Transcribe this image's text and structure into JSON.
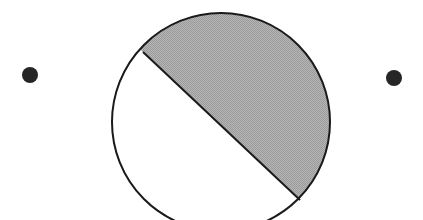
{
  "figure": {
    "kind": "geometry-diagram",
    "canvas": {
      "width": 423,
      "height": 220,
      "background_color": "#ffffff"
    },
    "circle": {
      "name": "main-circle",
      "center_x": 221,
      "center_y": 122,
      "radius": 109,
      "stroke_color": "#1a1a1a",
      "stroke_width": 2,
      "fill_color": "#ffffff"
    },
    "chord": {
      "name": "dividing-chord",
      "x1": 143,
      "y1": 52,
      "x2": 300,
      "y2": 200,
      "stroke_color": "#1a1a1a",
      "stroke_width": 2
    },
    "shaded_segment": {
      "name": "upper-right-segment",
      "fill_color": "#a8a8a8",
      "pattern": "fine-checkerboard-halftone",
      "pattern_dark": "#9a9a9a",
      "pattern_light": "#b6b6b6",
      "position": "upper-right of chord",
      "sweep": "major arc from chord start clockwise to chord end"
    },
    "unshaded_segment": {
      "name": "lower-left-segment",
      "fill_color": "#ffffff",
      "position": "lower-left of chord"
    },
    "dots": [
      {
        "name": "left-dot",
        "cx": 30,
        "cy": 75,
        "r": 8,
        "color": "#262626"
      },
      {
        "name": "right-dot",
        "cx": 394,
        "cy": 78,
        "r": 8,
        "color": "#262626"
      }
    ]
  }
}
